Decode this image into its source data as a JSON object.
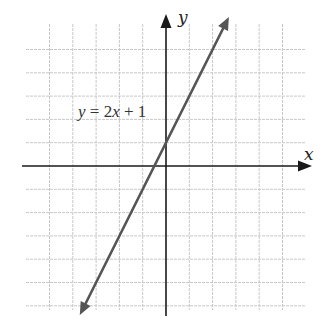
{
  "chart_data": {
    "type": "line",
    "title": "",
    "xlabel": "x",
    "ylabel": "y",
    "annotations": [
      {
        "text": "y = 2x + 1",
        "position": "upper-left of line"
      }
    ],
    "equation": {
      "slope": 2,
      "intercept": 1
    },
    "series": [
      {
        "name": "y = 2x + 1",
        "x": [
          -3.7,
          0,
          2.7
        ],
        "values": [
          -6.4,
          1,
          6.4
        ]
      }
    ],
    "xlim": [
      -6,
      6
    ],
    "ylim": [
      -6.5,
      6
    ],
    "grid": true,
    "grid_step": 1,
    "ticks_labeled": false
  },
  "labels": {
    "x_axis": "x",
    "y_axis": "y",
    "equation": "y = 2x + 1"
  },
  "colors": {
    "grid": "#c8c8c8",
    "axis": "#1a1a1a",
    "line": "#555555"
  }
}
